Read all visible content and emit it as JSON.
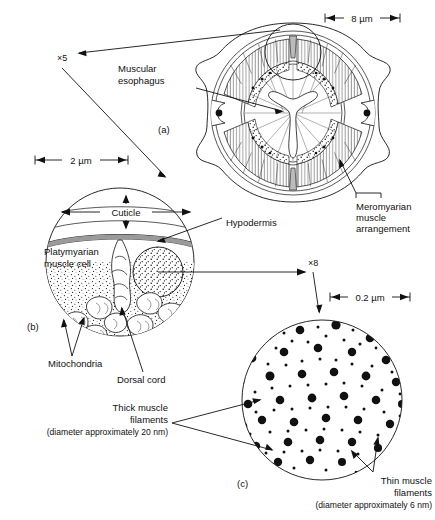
{
  "figure": {
    "kind": "scientific-diagram",
    "panels": [
      {
        "id": "a",
        "label": "(a)",
        "scale_bar": "8 µm"
      },
      {
        "id": "b",
        "label": "(b)",
        "scale_bar": "2 µm"
      },
      {
        "id": "c",
        "label": "(c)",
        "scale_bar": "0.2 µm"
      }
    ]
  },
  "scalebars": {
    "panel_a": "8 µm",
    "panel_b": "2 µm",
    "panel_c": "0.2 µm"
  },
  "magnifications": {
    "a_to_b": "×5",
    "b_to_c": "×8"
  },
  "panel_labels": {
    "a": "(a)",
    "b": "(b)",
    "c": "(c)"
  },
  "callouts": {
    "muscular_esophagus": "Muscular\nesophagus",
    "muscular_esophagus_l1": "Muscular",
    "muscular_esophagus_l2": "esophagus",
    "meromyarian_l1": "Meromyarian",
    "meromyarian_l2": "muscle",
    "meromyarian_l3": "arrangement",
    "cuticle": "Cuticle",
    "hypodermis": "Hypodermis",
    "platymyarian_l1": "Platymyarian",
    "platymyarian_l2": "muscle cell",
    "mitochondria": "Mitochondria",
    "dorsal_cord": "Dorsal cord",
    "thick_l1": "Thick muscle",
    "thick_l2": "filaments",
    "thick_l3": "(diameter approximately 20 nm)",
    "thin_l1": "Thin muscle",
    "thin_l2": "filaments",
    "thin_l3": "(diameter approximately 6 nm)"
  },
  "colors": {
    "ink": "#111111",
    "background": "#ffffff",
    "fill_gray": "#bcbcbc"
  }
}
